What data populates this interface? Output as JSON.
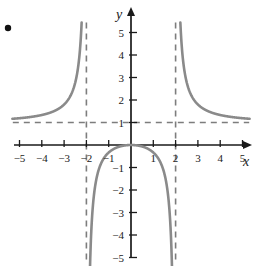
{
  "figure": {
    "title": "",
    "bullet_marker": {
      "name": "bullet-point",
      "x": 8,
      "y": 28
    }
  },
  "chart_data": {
    "type": "line",
    "title": "",
    "xlabel": "x",
    "ylabel": "y",
    "xlim": [
      -5.6,
      5.6
    ],
    "ylim": [
      -5.6,
      5.6
    ],
    "grid": false,
    "legend": null,
    "function": "y = x^2/(x^2 - 4)",
    "x_ticks": [
      -5,
      -4,
      -3,
      -2,
      -1,
      1,
      2,
      3,
      4,
      5
    ],
    "x_tick_labels": [
      "−5",
      "−4",
      "−3",
      "−2",
      "−1",
      "1",
      "2",
      "3",
      "4",
      "5"
    ],
    "y_ticks": [
      5,
      4,
      3,
      2,
      1,
      -1,
      -2,
      -3,
      -4,
      -5
    ],
    "y_tick_labels": [
      "5",
      "4",
      "3",
      "2",
      "1",
      "−1",
      "−2",
      "−3",
      "−4",
      "−5"
    ],
    "asymptotes": [
      {
        "name": "vertical-asymptote-left",
        "type": "vertical",
        "value": -2,
        "style": "dashed"
      },
      {
        "name": "vertical-asymptote-right",
        "type": "vertical",
        "value": 2,
        "style": "dashed"
      },
      {
        "name": "horizontal-asymptote",
        "type": "horizontal",
        "value": 1,
        "style": "dashed"
      }
    ],
    "series": [
      {
        "name": "left-branch",
        "x": [
          -5.3,
          -5.0,
          -4.6,
          -4.2,
          -3.8,
          -3.4,
          -3.0,
          -2.8,
          -2.6,
          -2.45,
          -2.35,
          -2.25,
          -2.18,
          -2.13,
          -2.1,
          -2.08
        ],
        "y": [
          1.165,
          1.19,
          1.275,
          1.287,
          1.38,
          1.49,
          1.8,
          2.042,
          2.407,
          2.981,
          3.523,
          4.469,
          5.2,
          5.6,
          5.9,
          6.2
        ]
      },
      {
        "name": "middle-branch",
        "x": [
          -2.08,
          -2.1,
          -2.13,
          -2.2,
          -2.3,
          -2.4,
          -2.6,
          -1.95,
          -1.9,
          -1.8,
          -1.6,
          -1.3,
          -1.0,
          -0.6,
          -0.3,
          0.0,
          0.3,
          0.6,
          1.0,
          1.3,
          1.6,
          1.8,
          1.9,
          1.95
        ],
        "y": [
          -5.0,
          -5.0,
          -5.0,
          -5.0,
          -5.0,
          -5.0,
          -5.0,
          -4.93,
          -3.95,
          -2.65,
          -1.78,
          -1.23,
          -0.333,
          -0.099,
          -0.0227,
          0.0,
          -0.0227,
          -0.099,
          -0.333,
          -1.23,
          -1.78,
          -2.65,
          -3.95,
          -4.93
        ]
      },
      {
        "name": "right-branch",
        "x": [
          2.08,
          2.1,
          2.13,
          2.18,
          2.25,
          2.35,
          2.45,
          2.6,
          2.8,
          3.0,
          3.4,
          3.8,
          4.2,
          4.6,
          5.0,
          5.3
        ],
        "y": [
          6.2,
          5.9,
          5.6,
          5.2,
          4.469,
          3.523,
          2.981,
          2.407,
          2.042,
          1.8,
          1.49,
          1.38,
          1.287,
          1.275,
          1.19,
          1.165
        ]
      }
    ],
    "colors": {
      "curve": "#8a8a8a",
      "axis": "#1a1a1a",
      "asymptote": "#7d7d7d",
      "background": "#ffffff",
      "tick_text": "#1a1a1a"
    }
  }
}
